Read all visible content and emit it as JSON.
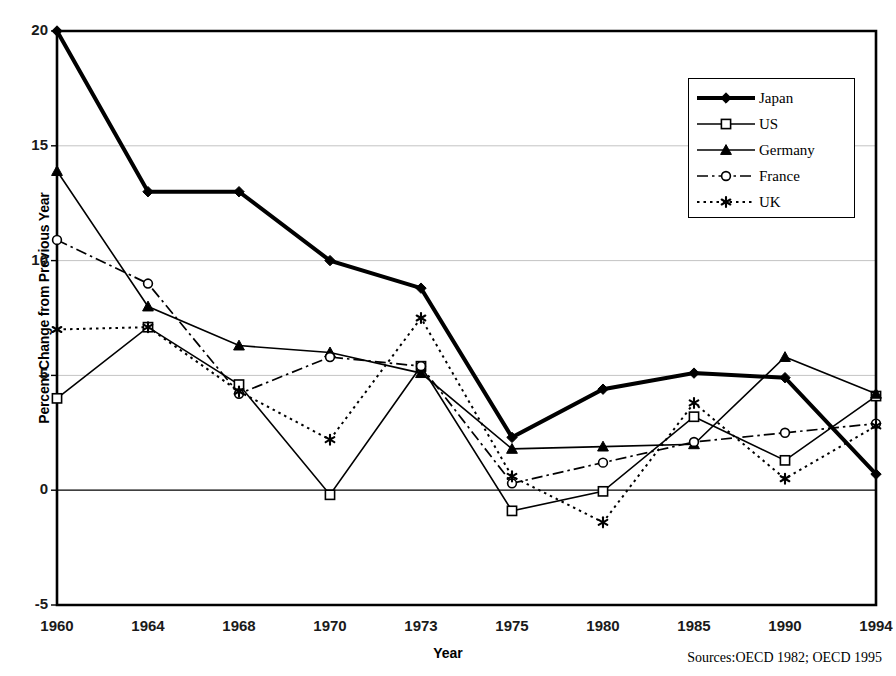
{
  "chart_data": {
    "type": "line",
    "title": "",
    "xlabel": "Year",
    "ylabel": "Percent Change from Previous Year",
    "source_note": "Sources:OECD 1982; OECD 1995",
    "categories": [
      "1960",
      "1964",
      "1968",
      "1970",
      "1973",
      "1975",
      "1980",
      "1985",
      "1990",
      "1994"
    ],
    "ylim": [
      -5,
      20
    ],
    "yticks": [
      "20",
      "15",
      "10",
      "5",
      "0",
      "-5"
    ],
    "ytick_values": [
      20,
      15,
      10,
      5,
      0,
      -5
    ],
    "grid": "horizontal",
    "legend_position": "top-right",
    "series": [
      {
        "name": "Japan",
        "marker": "filled-diamond",
        "line": "solid-bold",
        "color": "#000000",
        "values": [
          20.0,
          13.0,
          13.0,
          10.0,
          8.8,
          2.3,
          4.4,
          5.1,
          4.9,
          0.7
        ]
      },
      {
        "name": "US",
        "marker": "open-square",
        "line": "solid",
        "color": "#000000",
        "values": [
          4.0,
          7.1,
          4.6,
          -0.2,
          5.4,
          -0.9,
          -0.05,
          3.2,
          1.3,
          4.1
        ]
      },
      {
        "name": "Germany",
        "marker": "filled-triangle",
        "line": "solid",
        "color": "#000000",
        "values": [
          13.9,
          8.0,
          6.3,
          6.0,
          5.1,
          1.8,
          1.9,
          2.0,
          5.8,
          4.2
        ]
      },
      {
        "name": "France",
        "marker": "open-circle",
        "line": "dash-dot",
        "color": "#000000",
        "values": [
          10.9,
          9.0,
          4.2,
          5.8,
          5.4,
          0.3,
          1.2,
          2.1,
          2.5,
          2.9
        ]
      },
      {
        "name": "UK",
        "marker": "asterisk",
        "line": "dotted",
        "color": "#000000",
        "values": [
          7.0,
          7.1,
          4.3,
          2.2,
          7.5,
          0.6,
          -1.4,
          3.8,
          0.5,
          2.8
        ]
      }
    ]
  }
}
